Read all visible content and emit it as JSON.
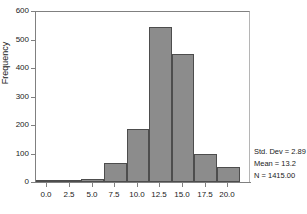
{
  "chart_data": {
    "type": "bar",
    "subtype": "histogram",
    "title": "",
    "xlabel": "",
    "ylabel": "Frequency",
    "grid": false,
    "legend_position": "right",
    "xlim": [
      -1.25,
      22.5
    ],
    "ylim": [
      0,
      600
    ],
    "bin_width": 2.5,
    "x_tick_labels": [
      "0.0",
      "2.5",
      "5.0",
      "7.5",
      "10.0",
      "12.5",
      "15.0",
      "17.5",
      "20.0"
    ],
    "x_tick_values": [
      0.0,
      2.5,
      5.0,
      7.5,
      10.0,
      12.5,
      15.0,
      17.5,
      20.0
    ],
    "y_tick_labels": [
      "0",
      "100",
      "200",
      "300",
      "400",
      "500",
      "600"
    ],
    "y_tick_values": [
      0,
      100,
      200,
      300,
      400,
      500,
      600
    ],
    "bin_edges": [
      -1.25,
      1.25,
      3.75,
      6.25,
      8.75,
      11.25,
      13.75,
      16.25,
      18.75,
      21.25
    ],
    "categories": [
      "0.0",
      "2.5",
      "5.0",
      "7.5",
      "10.0",
      "12.5",
      "15.0",
      "17.5",
      "20.0"
    ],
    "values": [
      1,
      3,
      10,
      65,
      185,
      545,
      448,
      97,
      52
    ],
    "bar_color": "#8c8c8c",
    "bar_edge_color": "#4d4d4d",
    "axis_color": "#808080"
  },
  "stats": {
    "std_dev": "Std. Dev = 2.89",
    "mean": "Mean = 13.2",
    "n": "N = 1415.00"
  }
}
